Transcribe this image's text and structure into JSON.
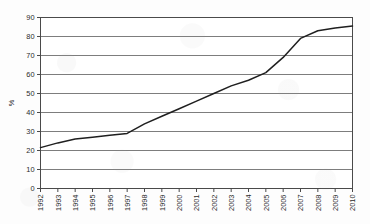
{
  "chart_data": {
    "type": "line",
    "title": "",
    "subtitle": "",
    "xlabel": "",
    "ylabel": "%",
    "x": [
      1992,
      1993,
      1994,
      1995,
      1996,
      1997,
      1998,
      1999,
      2000,
      2001,
      2002,
      2003,
      2004,
      2005,
      2006,
      2007,
      2008,
      2009,
      2010
    ],
    "categories": [
      "1992",
      "1993",
      "1994",
      "1995",
      "1996",
      "1997",
      "1998",
      "1999",
      "2000",
      "2001",
      "2002",
      "2003",
      "2004",
      "2005",
      "2006",
      "2007",
      "2008",
      "2009",
      "2010"
    ],
    "values": [
      21.5,
      24,
      26,
      27,
      28,
      29,
      34,
      38,
      42,
      46,
      50,
      54,
      57,
      61,
      69,
      79,
      83,
      84.5,
      85.5
    ],
    "series": [
      {
        "name": "",
        "values": [
          21.5,
          24,
          26,
          27,
          28,
          29,
          34,
          38,
          42,
          46,
          50,
          54,
          57,
          61,
          69,
          79,
          83,
          84.5,
          85.5
        ]
      }
    ],
    "ylim": [
      0,
      90
    ],
    "ytick_values": [
      0,
      10,
      20,
      30,
      40,
      50,
      60,
      70,
      80,
      90
    ],
    "ytick_labels": [
      "0",
      "10",
      "20",
      "30",
      "40",
      "50",
      "60",
      "70",
      "80",
      "90"
    ],
    "grid": "horizontal",
    "legend": "none",
    "line_color": "#1f1f1f",
    "grid_color": "#6e6e6e",
    "frame_color": "#4a4a4a",
    "plot_background": "#ffffff"
  },
  "axes": {
    "y_title": "%"
  }
}
